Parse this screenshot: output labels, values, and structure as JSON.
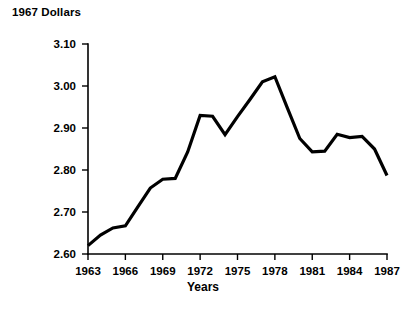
{
  "chart_data": {
    "type": "line",
    "title": "1967 Dollars",
    "xlabel": "Years",
    "ylabel": "",
    "grid": false,
    "legend": null,
    "xlim": [
      1963,
      1987
    ],
    "ylim": [
      2.6,
      3.1
    ],
    "xticks": [
      1963,
      1966,
      1969,
      1972,
      1975,
      1978,
      1981,
      1984,
      1987
    ],
    "xtick_labels": [
      "1963",
      "1966",
      "1969",
      "1972",
      "1975",
      "1978",
      "1981",
      "1984",
      "1987"
    ],
    "yticks": [
      2.6,
      2.7,
      2.8,
      2.9,
      3.0,
      3.1
    ],
    "ytick_labels": [
      "2.60",
      "2.70",
      "2.80",
      "2.90",
      "3.00",
      "3.10"
    ],
    "line_color": "#000000",
    "x": [
      1963,
      1964,
      1965,
      1966,
      1967,
      1968,
      1969,
      1970,
      1971,
      1972,
      1973,
      1974,
      1975,
      1976,
      1977,
      1978,
      1979,
      1980,
      1981,
      1982,
      1983,
      1984,
      1985,
      1986,
      1987
    ],
    "values": [
      2.62,
      2.645,
      2.662,
      2.667,
      2.712,
      2.757,
      2.778,
      2.78,
      2.843,
      2.93,
      2.928,
      2.884,
      2.927,
      2.968,
      3.01,
      3.022,
      2.948,
      2.875,
      2.843,
      2.845,
      2.885,
      2.877,
      2.88,
      2.85,
      2.787
    ],
    "series": [
      {
        "name": "1967 Dollars",
        "values": [
          2.62,
          2.645,
          2.662,
          2.667,
          2.712,
          2.757,
          2.778,
          2.78,
          2.843,
          2.93,
          2.928,
          2.884,
          2.927,
          2.968,
          3.01,
          3.022,
          2.948,
          2.875,
          2.843,
          2.845,
          2.885,
          2.877,
          2.88,
          2.85,
          2.787
        ]
      }
    ]
  },
  "layout": {
    "plot_left": 88,
    "plot_right": 387,
    "plot_top": 44,
    "plot_bottom": 254
  }
}
